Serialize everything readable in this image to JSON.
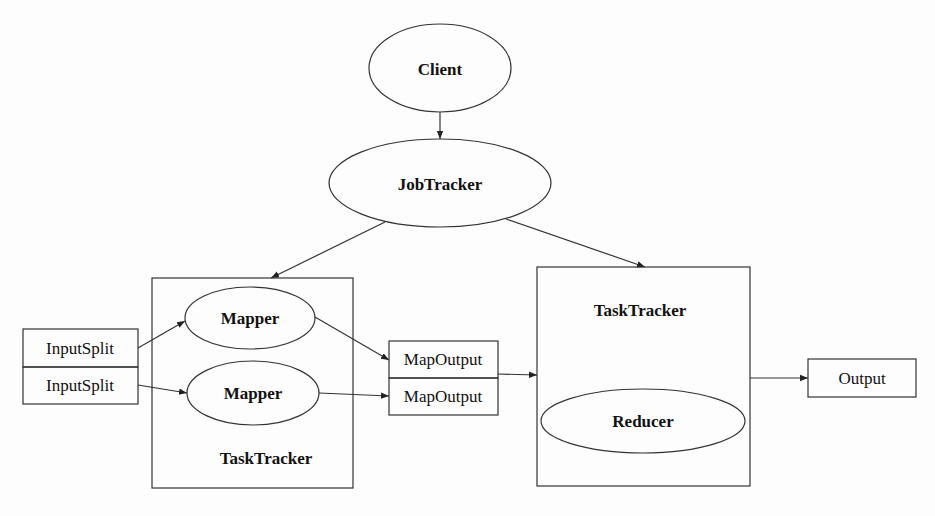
{
  "nodes": {
    "client": {
      "label": "Client"
    },
    "jobtracker": {
      "label": "JobTracker"
    },
    "tasktracker_map": {
      "label": "TaskTracker"
    },
    "tasktracker_reduce": {
      "label": "TaskTracker"
    },
    "mapper1": {
      "label": "Mapper"
    },
    "mapper2": {
      "label": "Mapper"
    },
    "reducer": {
      "label": "Reducer"
    },
    "inputsplit1": {
      "label": "InputSplit"
    },
    "inputsplit2": {
      "label": "InputSplit"
    },
    "mapoutput1": {
      "label": "MapOutput"
    },
    "mapoutput2": {
      "label": "MapOutput"
    },
    "output": {
      "label": "Output"
    }
  },
  "edges": [
    {
      "from": "Client",
      "to": "JobTracker"
    },
    {
      "from": "JobTracker",
      "to": "TaskTracker (map)"
    },
    {
      "from": "JobTracker",
      "to": "TaskTracker (reduce)"
    },
    {
      "from": "InputSplit",
      "to": "Mapper"
    },
    {
      "from": "InputSplit",
      "to": "Mapper"
    },
    {
      "from": "Mapper",
      "to": "MapOutput"
    },
    {
      "from": "Mapper",
      "to": "MapOutput"
    },
    {
      "from": "MapOutput",
      "to": "TaskTracker (reduce)"
    },
    {
      "from": "TaskTracker (reduce)",
      "to": "Output"
    }
  ]
}
